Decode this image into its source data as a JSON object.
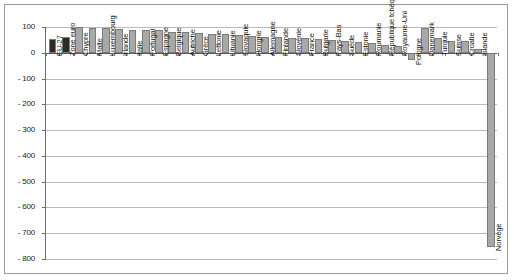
{
  "chart_data": {
    "type": "bar",
    "title": "",
    "subtitle": "",
    "xlabel": "",
    "ylabel": "",
    "ylim": [
      -800,
      100
    ],
    "ytick_values": [
      100,
      0,
      -100,
      -200,
      -300,
      -400,
      -500,
      -600,
      -700,
      -800
    ],
    "ytick_labels": [
      "100",
      "0",
      "- 100",
      "- 200",
      "- 300",
      "- 400",
      "- 500",
      "- 600",
      "- 700",
      "- 800"
    ],
    "grid": true,
    "legend": "none",
    "categories": [
      "EU-27",
      "Zone euro",
      "Chypre",
      "Malte",
      "Luxembourg",
      "Irlande",
      "Italie",
      "Portugal",
      "Espagne",
      "Belgique",
      "Autriche",
      "Grèce",
      "Lettonie",
      "Lituanie",
      "Slovaquie",
      "Hongrie",
      "Allemagne",
      "Finlande",
      "Slovénie",
      "France",
      "Bulgarie",
      "Pays-Bas",
      "Suède",
      "Estonie",
      "Roumanie",
      "République tchèque",
      "Royaume-Uni",
      "Pologne",
      "Danemark",
      "Turquie",
      "Suisse",
      "Croatie",
      "Islande",
      "Norvège"
    ],
    "values": [
      55,
      62,
      100,
      98,
      98,
      93,
      90,
      88,
      88,
      82,
      80,
      78,
      74,
      72,
      70,
      66,
      62,
      60,
      58,
      56,
      52,
      48,
      44,
      40,
      36,
      32,
      28,
      -30,
      97,
      56,
      44,
      46,
      16,
      -755
    ],
    "highlight_indices": [
      0,
      1
    ],
    "colors": {
      "bar_fill": "#a8a8a8",
      "bar_fill_highlight": "#2b2b2b",
      "bar_stroke": "#7b7b7b",
      "grid": "#b9b9b9",
      "axis": "#6d6d6d",
      "text": "#131313",
      "frame": "#9a9a9a",
      "background": "#ffffff"
    }
  }
}
